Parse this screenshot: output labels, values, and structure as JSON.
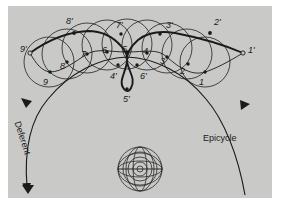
{
  "figure": {
    "background_color": "#c9c9c7",
    "page_color": "#ffffff",
    "stroke_color": "#1a1a1a"
  },
  "annotations": {
    "deferent": "Deferent",
    "epicycle": "Epicycle"
  },
  "inner_points": [
    {
      "label": "1",
      "lx": 199,
      "ly": 78,
      "dx": 205,
      "dy": 72
    },
    {
      "label": "2",
      "lx": 180,
      "ly": 67,
      "dx": 188,
      "dy": 64
    },
    {
      "label": "3",
      "lx": 160,
      "ly": 57,
      "dx": 167,
      "dy": 57
    },
    {
      "label": "4",
      "lx": 143,
      "ly": 47,
      "dx": 147,
      "dy": 53
    },
    {
      "label": "5",
      "lx": 122,
      "ly": 45,
      "dx": 127,
      "dy": 52
    },
    {
      "label": "6",
      "lx": 102,
      "ly": 46,
      "dx": 107,
      "dy": 52
    },
    {
      "label": "7",
      "lx": 81,
      "ly": 50,
      "dx": 87,
      "dy": 54
    },
    {
      "label": "8",
      "lx": 60,
      "ly": 62,
      "dx": 67,
      "dy": 62
    },
    {
      "label": "9",
      "lx": 43,
      "ly": 78,
      "dx": 50,
      "dy": 72
    }
  ],
  "outer_points": [
    {
      "label": "1'",
      "lx": 248,
      "ly": 46,
      "dx": 243,
      "dy": 53
    },
    {
      "label": "2'",
      "lx": 214,
      "ly": 18,
      "dx": 210,
      "dy": 31
    },
    {
      "label": "3'",
      "lx": 166,
      "ly": 21,
      "dx": 160,
      "dy": 32
    },
    {
      "label": "4'",
      "lx": 110,
      "ly": 72,
      "dx": 117,
      "dy": 68
    },
    {
      "label": "5'",
      "lx": 125,
      "ly": 95,
      "dx": 127,
      "dy": 89
    },
    {
      "label": "6'",
      "lx": 140,
      "ly": 72,
      "dx": 138,
      "dy": 68
    },
    {
      "label": "7'",
      "lx": 116,
      "ly": 21,
      "dx": 121,
      "dy": 32
    },
    {
      "label": "8'",
      "lx": 66,
      "ly": 17,
      "dx": 74,
      "dy": 31
    },
    {
      "label": "9'",
      "lx": 20,
      "ly": 45,
      "dx": 30,
      "dy": 53
    }
  ],
  "epicycles": [
    {
      "cx": 205,
      "cy": 62,
      "r": 25
    },
    {
      "cx": 187,
      "cy": 54,
      "r": 25
    },
    {
      "cx": 167,
      "cy": 48,
      "r": 25
    },
    {
      "cx": 147,
      "cy": 45,
      "r": 25
    },
    {
      "cx": 127,
      "cy": 44,
      "r": 25
    },
    {
      "cx": 107,
      "cy": 45,
      "r": 25
    },
    {
      "cx": 87,
      "cy": 48,
      "r": 25
    },
    {
      "cx": 67,
      "cy": 54,
      "r": 25
    },
    {
      "cx": 49,
      "cy": 62,
      "r": 25
    }
  ],
  "earth": {
    "cx": 140,
    "cy": 169,
    "r": 23,
    "description": "central earth globe with concentric circles and radial lines"
  }
}
